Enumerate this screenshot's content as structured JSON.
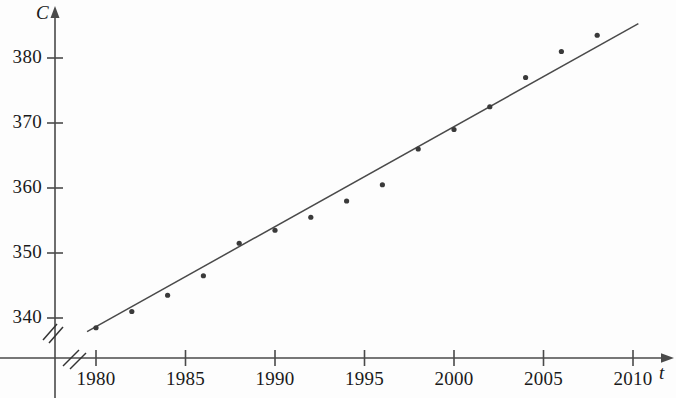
{
  "chart_data": {
    "type": "scatter",
    "title": "",
    "subtitle": "",
    "xlabel": "t",
    "ylabel": "C",
    "xlim": [
      1979,
      2010.5
    ],
    "ylim": [
      337,
      385
    ],
    "grid": false,
    "legend": null,
    "axis_break_x": true,
    "axis_break_y": true,
    "x_ticks": [
      1980,
      1985,
      1990,
      1995,
      2000,
      2005,
      2010
    ],
    "x_tick_labels": [
      "1980",
      "1985",
      "1990",
      "1995",
      "2000",
      "2005",
      "2010"
    ],
    "y_ticks": [
      340,
      350,
      360,
      370,
      380
    ],
    "y_tick_labels": [
      "340",
      "350",
      "360",
      "370",
      "380"
    ],
    "series": [
      {
        "name": "data points",
        "type": "scatter",
        "marker": "dot",
        "color": "#3a3a3a",
        "x": [
          1980,
          1982,
          1984,
          1986,
          1988,
          1990,
          1992,
          1994,
          1996,
          1998,
          2000,
          2002,
          2004,
          2006,
          2008
        ],
        "values": [
          338.5,
          341.0,
          343.5,
          346.5,
          351.5,
          353.5,
          355.5,
          358.0,
          360.5,
          366.0,
          369.0,
          372.5,
          377.0,
          381.0,
          383.5
        ]
      },
      {
        "name": "regression line",
        "type": "line",
        "color": "#4a4a4a",
        "x": [
          1979.5,
          2010.3
        ],
        "values": [
          337.9,
          385.3
        ]
      }
    ]
  },
  "axis_names": {
    "y": "C",
    "x": "t"
  },
  "icons": {
    "x_arrow": "arrow-right-icon",
    "y_arrow": "arrow-up-icon",
    "break_mark": "axis-break-icon"
  },
  "colors": {
    "axis": "#4a4a4a",
    "point": "#3a3a3a",
    "line": "#4a4a4a",
    "text": "#1a1a1a",
    "background": "#fdfdfd"
  }
}
